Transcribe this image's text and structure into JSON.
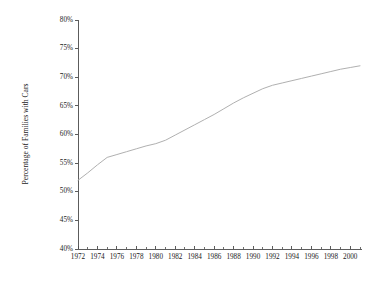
{
  "chart_data": {
    "type": "line",
    "title": "",
    "xlabel": "",
    "ylabel": "Percentage of Families with Cars",
    "xlim": [
      1972,
      2001
    ],
    "ylim": [
      40,
      80
    ],
    "grid": false,
    "legend": false,
    "y_tick_labels": [
      "80%",
      "75%",
      "70%",
      "65%",
      "60%",
      "55%",
      "50%",
      "45%",
      "40%"
    ],
    "y_tick_values": [
      80,
      75,
      70,
      65,
      60,
      55,
      50,
      45,
      40
    ],
    "x_tick_labels": [
      "1972",
      "1974",
      "1976",
      "1978",
      "1980",
      "1982",
      "1984",
      "1986",
      "1988",
      "1990",
      "1992",
      "1994",
      "1996",
      "1998",
      "2000"
    ],
    "x_tick_values": [
      1972,
      1974,
      1976,
      1978,
      1980,
      1982,
      1984,
      1986,
      1988,
      1990,
      1992,
      1994,
      1996,
      1998,
      2000
    ],
    "x_minor_ticks": [
      1972,
      1973,
      1974,
      1975,
      1976,
      1977,
      1978,
      1979,
      1980,
      1981,
      1982,
      1983,
      1984,
      1985,
      1986,
      1987,
      1988,
      1989,
      1990,
      1991,
      1992,
      1993,
      1994,
      1995,
      1996,
      1997,
      1998,
      1999,
      2000,
      2001
    ],
    "series": [
      {
        "name": "Percentage of Families with Cars",
        "color": "#b0b0b0",
        "x": [
          1972,
          1973,
          1974,
          1975,
          1976,
          1977,
          1978,
          1979,
          1980,
          1981,
          1982,
          1983,
          1984,
          1985,
          1986,
          1987,
          1988,
          1989,
          1990,
          1991,
          1992,
          1993,
          1994,
          1995,
          1996,
          1997,
          1998,
          1999,
          2000,
          2001
        ],
        "values": [
          52.0,
          53.3,
          54.7,
          56.0,
          56.5,
          57.0,
          57.5,
          58.0,
          58.4,
          59.0,
          59.9,
          60.8,
          61.7,
          62.6,
          63.5,
          64.5,
          65.5,
          66.4,
          67.2,
          68.0,
          68.6,
          69.0,
          69.4,
          69.8,
          70.2,
          70.6,
          71.0,
          71.4,
          71.7,
          72.0
        ]
      }
    ]
  },
  "colors": {
    "background": "#ffffff",
    "axis": "#4a4a4a",
    "line": "#b0b0b0",
    "text": "#1a1a1a"
  }
}
